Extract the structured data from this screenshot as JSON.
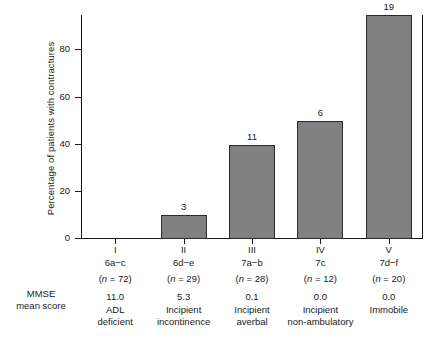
{
  "chart_data": {
    "type": "bar",
    "title": "",
    "xlabel": "",
    "ylabel": "Percentage of patients with contractures",
    "ylim": [
      0,
      95
    ],
    "yticks": [
      0,
      20,
      40,
      60,
      80
    ],
    "grid": false,
    "legend": null,
    "categories": [
      "I",
      "II",
      "III",
      "IV",
      "V"
    ],
    "values": [
      0,
      10,
      40,
      50,
      95
    ],
    "bar_labels": [
      "",
      "3",
      "11",
      "6",
      "19"
    ],
    "bar_label_meaning": "number of patients with contractures",
    "series": [
      {
        "name": "Percentage of patients with contractures",
        "values": [
          0,
          10,
          40,
          50,
          95
        ]
      }
    ],
    "columns": [
      {
        "roman": "I",
        "code": "6a−c",
        "n_text": "(n = 72)",
        "n": 72,
        "mmse": "11.0",
        "desc_line1": "ADL",
        "desc_line2": "deficient",
        "count": "",
        "percent": 0
      },
      {
        "roman": "II",
        "code": "6d−e",
        "n_text": "(n = 29)",
        "n": 29,
        "mmse": "5.3",
        "desc_line1": "Incipient",
        "desc_line2": "incontinence",
        "count": "3",
        "percent": 10
      },
      {
        "roman": "III",
        "code": "7a−b",
        "n_text": "(n = 28)",
        "n": 28,
        "mmse": "0.1",
        "desc_line1": "Incipient",
        "desc_line2": "averbal",
        "count": "11",
        "percent": 40
      },
      {
        "roman": "IV",
        "code": "7c",
        "n_text": "(n = 12)",
        "n": 12,
        "mmse": "0.0",
        "desc_line1": "Incipient",
        "desc_line2": "non-ambulatory",
        "count": "6",
        "percent": 50
      },
      {
        "roman": "V",
        "code": "7d−f",
        "n_text": "(n = 20)",
        "n": 20,
        "mmse": "0.0",
        "desc_line1": "Immobile",
        "desc_line2": "",
        "count": "19",
        "percent": 95
      }
    ],
    "row_label_line1": "MMSE",
    "row_label_line2": "mean score",
    "colors": {
      "bar_fill": "#808080",
      "bar_border": "#2b2b2b",
      "axis": "#1a1a1a",
      "text": "#1a1a1a",
      "background": "#ffffff"
    }
  }
}
